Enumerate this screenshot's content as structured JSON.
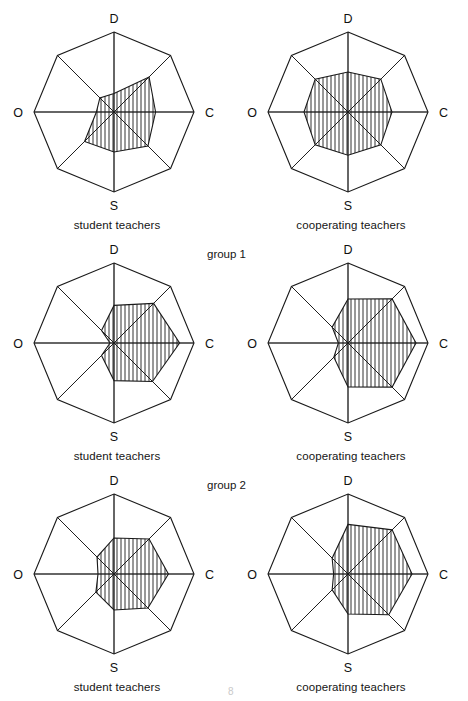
{
  "figure": {
    "width": 468,
    "height": 701,
    "background": "#ffffff",
    "stroke_color": "#1a1a1a",
    "hatch_color": "#1a1a1a",
    "page_mark": "8"
  },
  "group_labels": [
    {
      "text": "group 1",
      "x": 207,
      "y": 248
    },
    {
      "text": "group 2",
      "x": 207,
      "y": 479
    }
  ],
  "axes": {
    "count": 8,
    "labelled": [
      {
        "key": "D",
        "label": "D",
        "angle_deg": 90
      },
      {
        "key": "C",
        "label": "C",
        "angle_deg": 0
      },
      {
        "key": "S",
        "label": "S",
        "angle_deg": 270
      },
      {
        "key": "O",
        "label": "O",
        "angle_deg": 180
      }
    ],
    "unlabelled_angles_deg": [
      45,
      315,
      225,
      135
    ],
    "order_clockwise_from_top": [
      "D",
      "DC",
      "C",
      "CS",
      "S",
      "SO",
      "O",
      "OD"
    ]
  },
  "chart_data": [
    {
      "id": "group1-student-teachers",
      "type": "radar",
      "title": "student teachers",
      "group": "group 1",
      "row": 0,
      "col": 0,
      "center": [
        114,
        117
      ],
      "outer_radius": 80,
      "rlim": [
        0,
        1
      ],
      "categories": [
        "D",
        "DC",
        "C",
        "CS",
        "S",
        "SO",
        "O",
        "OD"
      ],
      "axis_labels": [
        "D",
        "",
        "C",
        "",
        "S",
        "",
        "O",
        ""
      ],
      "values": [
        0.23,
        0.62,
        0.52,
        0.6,
        0.5,
        0.52,
        0.22,
        0.25
      ],
      "fill": "hatch-vertical",
      "grid": false
    },
    {
      "id": "group1-cooperating-teachers",
      "type": "radar",
      "title": "cooperating teachers",
      "group": "group 1",
      "row": 0,
      "col": 1,
      "center": [
        348,
        117
      ],
      "outer_radius": 80,
      "rlim": [
        0,
        1
      ],
      "categories": [
        "D",
        "DC",
        "C",
        "CS",
        "S",
        "SO",
        "O",
        "OD"
      ],
      "axis_labels": [
        "D",
        "",
        "C",
        "",
        "S",
        "",
        "O",
        ""
      ],
      "values": [
        0.5,
        0.58,
        0.55,
        0.58,
        0.54,
        0.58,
        0.55,
        0.58
      ],
      "fill": "hatch-vertical",
      "grid": false
    },
    {
      "id": "group2-student-teachers",
      "type": "radar",
      "title": "student teachers",
      "group": "group 1",
      "row": 1,
      "col": 0,
      "center": [
        114,
        348
      ],
      "outer_radius": 80,
      "rlim": [
        0,
        1
      ],
      "categories": [
        "D",
        "DC",
        "C",
        "CS",
        "S",
        "SO",
        "O",
        "OD"
      ],
      "axis_labels": [
        "D",
        "",
        "C",
        "",
        "S",
        "",
        "O",
        ""
      ],
      "values": [
        0.47,
        0.7,
        0.82,
        0.68,
        0.47,
        0.22,
        0.05,
        0.22
      ],
      "fill": "hatch-vertical",
      "grid": false
    },
    {
      "id": "group2-cooperating-teachers",
      "type": "radar",
      "title": "cooperating teachers",
      "group": "group 1",
      "row": 1,
      "col": 1,
      "center": [
        348,
        348
      ],
      "outer_radius": 80,
      "rlim": [
        0,
        1
      ],
      "categories": [
        "D",
        "DC",
        "C",
        "CS",
        "S",
        "SO",
        "O",
        "OD"
      ],
      "axis_labels": [
        "D",
        "",
        "C",
        "",
        "S",
        "",
        "O",
        ""
      ],
      "values": [
        0.55,
        0.78,
        0.85,
        0.78,
        0.55,
        0.25,
        0.12,
        0.28
      ],
      "fill": "hatch-vertical",
      "grid": false
    },
    {
      "id": "group3-student-teachers",
      "type": "radar",
      "title": "student teachers",
      "group": "group 2",
      "row": 2,
      "col": 0,
      "center": [
        114,
        580
      ],
      "outer_radius": 80,
      "rlim": [
        0,
        1
      ],
      "categories": [
        "D",
        "DC",
        "C",
        "CS",
        "S",
        "SO",
        "O",
        "OD"
      ],
      "axis_labels": [
        "D",
        "",
        "C",
        "",
        "S",
        "",
        "O",
        ""
      ],
      "values": [
        0.45,
        0.62,
        0.68,
        0.6,
        0.45,
        0.32,
        0.2,
        0.3
      ],
      "fill": "hatch-vertical",
      "grid": false
    },
    {
      "id": "group3-cooperating-teachers",
      "type": "radar",
      "title": "cooperating teachers",
      "group": "group 2",
      "row": 2,
      "col": 1,
      "center": [
        348,
        580
      ],
      "outer_radius": 80,
      "rlim": [
        0,
        1
      ],
      "categories": [
        "D",
        "DC",
        "C",
        "CS",
        "S",
        "SO",
        "O",
        "OD"
      ],
      "axis_labels": [
        "D",
        "",
        "C",
        "",
        "S",
        "",
        "O",
        ""
      ],
      "values": [
        0.62,
        0.78,
        0.8,
        0.72,
        0.5,
        0.28,
        0.18,
        0.28
      ],
      "fill": "hatch-vertical",
      "grid": false
    }
  ]
}
